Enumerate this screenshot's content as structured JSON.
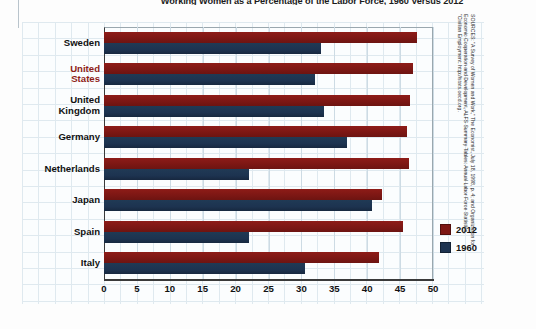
{
  "title": "Working Women as a Percentage of the Labor Force, 1960 Versus 2012",
  "legend": {
    "items": [
      "2012",
      "1960"
    ]
  },
  "source": {
    "line1": "SOURCES: \"A Survey of Women and Work,\" The Economist, July 18, 1998, p. 4; and Organization for",
    "line2": "Economic Cooperation and Development, ALFS Summary Tables: Annual Labor Force Statistics,",
    "line3": "\"Civilian Employment: http://stats.oecd.org."
  },
  "colors": {
    "series_2012": "#7d1714",
    "series_1960": "#1d3350",
    "highlight_label": "#8e1c18",
    "grid": "#dfe9ef",
    "axis": "#3a3a3a"
  },
  "chart_data": {
    "type": "bar",
    "orientation": "horizontal",
    "title": "Working Women as a Percentage of the Labor Force, 1960 Versus 2012",
    "xlabel": "",
    "ylabel": "",
    "xlim": [
      0,
      50
    ],
    "xticks": [
      "0",
      "5",
      "10",
      "15",
      "20",
      "25",
      "30",
      "35",
      "40",
      "45",
      "50"
    ],
    "grid": true,
    "legend_position": "right",
    "categories": [
      "Sweden",
      "United States",
      "United Kingdom",
      "Germany",
      "Netherlands",
      "Japan",
      "Spain",
      "Italy"
    ],
    "category_labels": [
      "Sweden",
      "United\nStates",
      "United\nKingdom",
      "Germany",
      "Netherlands",
      "Japan",
      "Spain",
      "Italy"
    ],
    "series": [
      {
        "name": "2012",
        "values": [
          47.5,
          47.0,
          46.5,
          46.0,
          46.3,
          42.3,
          45.5,
          41.8
        ]
      },
      {
        "name": "1960",
        "values": [
          33.0,
          32.0,
          33.5,
          37.0,
          22.0,
          40.8,
          22.0,
          30.5
        ]
      }
    ]
  }
}
